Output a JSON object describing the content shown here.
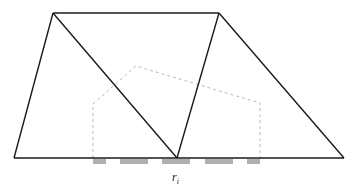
{
  "diagram": {
    "label": {
      "main": "r",
      "sub": "i"
    },
    "colors": {
      "edge": "#1a1a1a",
      "dashed": "#b8b8b8",
      "segment": "#b0b0b0"
    }
  }
}
